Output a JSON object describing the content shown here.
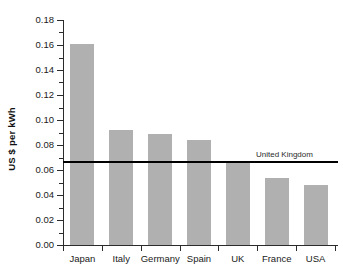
{
  "chart_data": {
    "type": "bar",
    "title": "",
    "subtitle": "",
    "xlabel": "",
    "ylabel": "US $ per kWh",
    "categories": [
      "Japan",
      "Italy",
      "Germany",
      "Spain",
      "UK",
      "France",
      "USA"
    ],
    "values": [
      0.161,
      0.092,
      0.089,
      0.084,
      0.067,
      0.054,
      0.048
    ],
    "series": [
      {
        "name": "Electricity price",
        "values": [
          0.161,
          0.092,
          0.089,
          0.084,
          0.067,
          0.054,
          0.048
        ]
      }
    ],
    "ylim": [
      0.0,
      0.18
    ],
    "xlim": [
      0,
      7
    ],
    "y_tick_step": 0.02,
    "y_minor_tick_step": 0.01,
    "y_tick_labels": [
      "0.00",
      "0.02",
      "0.04",
      "0.06",
      "0.08",
      "0.10",
      "0.12",
      "0.14",
      "0.16",
      "0.18"
    ],
    "y_tick_values": [
      0.0,
      0.02,
      0.04,
      0.06,
      0.08,
      0.1,
      0.12,
      0.14,
      0.16,
      0.18
    ],
    "y_minor_tick_values": [
      0.01,
      0.03,
      0.05,
      0.07,
      0.09,
      0.11,
      0.13,
      0.15,
      0.17
    ],
    "grid": false,
    "legend": null,
    "legend_position": "none",
    "bar_color": "#b0b0b0",
    "axis_color": "#2b2b2b",
    "background_color": "#ffffff",
    "annotations": [
      {
        "type": "hline",
        "label": "United Kingdom",
        "value": 0.067,
        "color": "#000000",
        "label_position": "above-right"
      }
    ]
  }
}
